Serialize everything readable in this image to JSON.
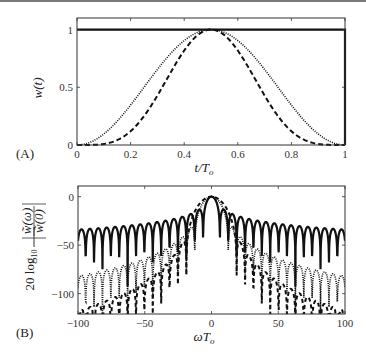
{
  "chart_data": [
    {
      "panel": "A",
      "type": "line",
      "title": "",
      "xlabel": "t/T_o",
      "ylabel": "w(t)",
      "xlim": [
        0,
        1
      ],
      "ylim": [
        0,
        1.1
      ],
      "x_ticks": [
        "0",
        "0.2",
        "0.4",
        "0.6",
        "0.8",
        "1"
      ],
      "x_tick_values": [
        0,
        0.2,
        0.4,
        0.6,
        0.8,
        1
      ],
      "y_ticks": [
        "0",
        "0.5",
        "1"
      ],
      "y_tick_values": [
        0,
        0.5,
        1
      ],
      "grid": false,
      "legend": null,
      "series": [
        {
          "name": "rectangular",
          "style": "solid",
          "formula": "w=1 for 0<=t<=1",
          "x": [
            0,
            0.2,
            0.4,
            0.5,
            0.6,
            0.8,
            1
          ],
          "values": [
            1,
            1,
            1,
            1,
            1,
            1,
            1
          ]
        },
        {
          "name": "hann (sin^2)",
          "style": "dotted",
          "formula": "sin^2(pi t)",
          "x": [
            0,
            0.1,
            0.2,
            0.3,
            0.4,
            0.5,
            0.6,
            0.7,
            0.8,
            0.9,
            1
          ],
          "values": [
            0,
            0.1,
            0.35,
            0.65,
            0.9,
            1,
            0.9,
            0.65,
            0.35,
            0.1,
            0
          ]
        },
        {
          "name": "sin^4",
          "style": "dashed",
          "formula": "sin^4(pi t)",
          "x": [
            0,
            0.1,
            0.2,
            0.3,
            0.4,
            0.5,
            0.6,
            0.7,
            0.8,
            0.9,
            1
          ],
          "values": [
            0,
            0.01,
            0.12,
            0.43,
            0.82,
            1,
            0.82,
            0.43,
            0.12,
            0.01,
            0
          ]
        }
      ]
    },
    {
      "panel": "B",
      "type": "line",
      "title": "",
      "xlabel": "ωT_o",
      "ylabel": "20 log10 |W̃(ω)/W̃(0)|",
      "xlim": [
        -100,
        100
      ],
      "ylim": [
        -121,
        11
      ],
      "x_ticks": [
        "-100",
        "-50",
        "0",
        "50",
        "100"
      ],
      "x_tick_values": [
        -100,
        -50,
        0,
        50,
        100
      ],
      "y_ticks": [
        "0",
        "-50",
        "-100"
      ],
      "y_tick_values": [
        0,
        -50,
        -100
      ],
      "grid": false,
      "legend": null,
      "series": [
        {
          "name": "rectangular",
          "style": "solid",
          "description": "sinc sidelobes, envelope ~ -13 dB near center decaying to ~ -35 dB at |ωT_o|=100, nulls dipping to ~ -50 dB",
          "x": [
            -100,
            -50,
            -20,
            0,
            20,
            50,
            100
          ],
          "values": [
            -36,
            -30,
            -22,
            0,
            -22,
            -30,
            -36
          ]
        },
        {
          "name": "hann (sin^2)",
          "style": "dotted",
          "description": "wider main lobe, sidelobes decaying ~18 dB/oct, ~ -80 dB at |ωT_o|=100",
          "x": [
            -100,
            -50,
            -20,
            0,
            20,
            50,
            100
          ],
          "values": [
            -80,
            -62,
            -45,
            0,
            -45,
            -62,
            -80
          ]
        },
        {
          "name": "sin^4",
          "style": "dashed",
          "description": "widest main lobe, sidelobes below -100 dB beyond |ωT_o|~25",
          "x": [
            -100,
            -50,
            -25,
            0,
            25,
            50,
            100
          ],
          "values": [
            -110,
            -102,
            -92,
            0,
            -92,
            -102,
            -110
          ]
        }
      ]
    }
  ],
  "panels": {
    "a": {
      "label": "(A)",
      "ylabel": "w(t)",
      "xlabel_main": "t/T",
      "xlabel_sub": "o"
    },
    "b": {
      "label": "(B)",
      "ylabel_prefix": "20 log",
      "ylabel_sub": "10",
      "ylabel_num": "w̃(ω)",
      "ylabel_den": "w̃(0)",
      "xlabel_main": "ωT",
      "xlabel_sub": "o"
    }
  },
  "geometry": {
    "a": {
      "x0": 77,
      "x1": 345,
      "y0": 18,
      "y1": 145,
      "xmin": 0,
      "xmax": 1,
      "ymin": 0,
      "ymax": 1.1
    },
    "b": {
      "x0": 78,
      "x1": 345,
      "y0": 186,
      "y1": 314,
      "xmin": -100,
      "xmax": 100,
      "ymin": -121,
      "ymax": 11
    }
  },
  "colors": {
    "line": "#111111",
    "axis": "#333333",
    "tick_text": "#333333",
    "top_rule": "#7a7a7a"
  }
}
